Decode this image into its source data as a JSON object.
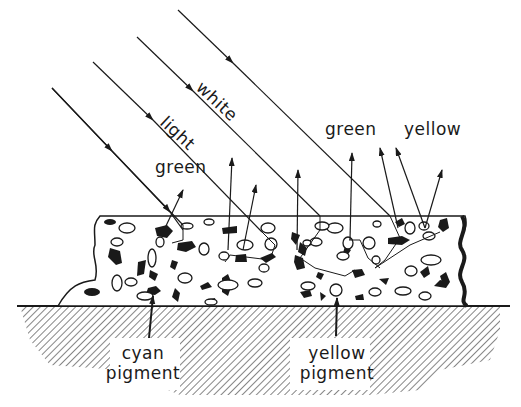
{
  "diagram": {
    "title": "",
    "labels": {
      "white": "white",
      "light": "light",
      "green_left": "green",
      "green_right": "green",
      "yellow_top": "yellow",
      "cyan_line1": "cyan",
      "cyan_line2": "pigment",
      "yellow_line1": "yellow",
      "yellow_line2": "pigment"
    },
    "colors": {
      "ink": "#1a1a1a",
      "background": "#ffffff"
    }
  }
}
